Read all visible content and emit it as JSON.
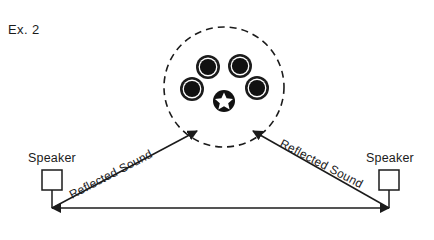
{
  "figure": {
    "caption": "Ex. 2",
    "background_color": "#ffffff",
    "ink_color": "#1b1b1b"
  },
  "listening_area": {
    "boundary_name": "dashed-listening-zone",
    "boundary_style": "dashed-circle",
    "center_x": 224,
    "center_y": 87,
    "radius": 60,
    "listener_marker": {
      "name": "listener-position-star",
      "shape": "white-star-in-black-disc",
      "x": 224,
      "y": 101,
      "radius": 11
    },
    "drivers": [
      {
        "label": "driver-upper-left",
        "x": 208,
        "y": 67,
        "radius": 12
      },
      {
        "label": "driver-upper-right",
        "x": 240,
        "y": 66,
        "radius": 12
      },
      {
        "label": "driver-lower-left",
        "x": 192,
        "y": 89,
        "radius": 12
      },
      {
        "label": "driver-lower-right",
        "x": 257,
        "y": 88,
        "radius": 12
      }
    ]
  },
  "speakers": [
    {
      "side": "left",
      "label": "Speaker",
      "label_x": 58,
      "label_y": 162,
      "box_x": 42,
      "box_y": 170,
      "box_size": 20,
      "stem_bottom_y": 208
    },
    {
      "side": "right",
      "label": "Speaker",
      "label_x": 396,
      "label_y": 162,
      "box_x": 379,
      "box_y": 170,
      "box_size": 20,
      "stem_bottom_y": 208
    }
  ],
  "sound_paths": [
    {
      "name": "reflected-sound-left",
      "label": "Reflected Sound",
      "from_x": 52,
      "from_y": 208,
      "to_x": 197,
      "to_y": 131,
      "label_angle": -27.5,
      "label_x": 72,
      "label_y": 199
    },
    {
      "name": "reflected-sound-right",
      "label": "Reflected Sound",
      "from_x": 389,
      "from_y": 208,
      "to_x": 253,
      "to_y": 131,
      "label_angle": 27.5,
      "label_x": 279,
      "label_y": 146
    }
  ],
  "baseline": {
    "name": "speaker-baseline",
    "x1": 52,
    "y1": 208,
    "x2": 389,
    "y2": 208
  }
}
